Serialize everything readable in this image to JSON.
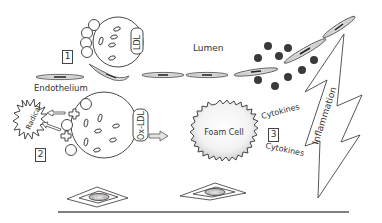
{
  "figure": {
    "labels": {
      "lumen": "Lumen",
      "endothelium": "Endothelium",
      "ldl": "LDL",
      "ox_ldl": "Ox-LDL",
      "radical": "Radical",
      "foam_cell": "Foam Cell",
      "cytokines_top": "Cytokines",
      "cytokines_bottom": "Cytokines",
      "inflammation": "Inflammation",
      "smc_left": "SMC",
      "smc_right": "SMC"
    },
    "steps": [
      "1",
      "2",
      "3"
    ],
    "colors": {
      "line": "#333333",
      "cell_fill": "#d9d9d9",
      "particle": "#3a3a3a",
      "background": "#ffffff"
    }
  }
}
